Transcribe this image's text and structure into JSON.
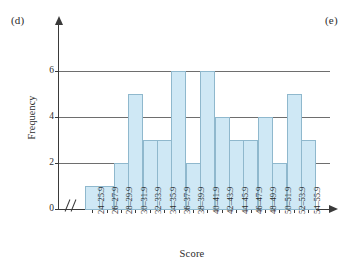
{
  "figure": {
    "panel_label_left": "(d)",
    "panel_label_right": "(e)",
    "bar_fill_color": "#cfe8f5",
    "bar_border_color": "#8fb8cd",
    "axis_color": "#3a3a3a",
    "gridline_color": "#6e6e6e",
    "axis_break_symbol": "//"
  },
  "chart_data": {
    "type": "bar",
    "title": "",
    "xlabel": "Score",
    "ylabel": "Frequency",
    "categories": [
      "24–25.9",
      "26–27.9",
      "28–29.9",
      "30–31.9",
      "32–33.9",
      "34–35.9",
      "36–37.9",
      "38–39.9",
      "40–41.9",
      "42–43.9",
      "44–45.9",
      "46–47.9",
      "48–49.9",
      "50–51.9",
      "52–53.9",
      "54–55.9"
    ],
    "values": [
      1,
      1,
      2,
      5,
      3,
      3,
      6,
      2,
      6,
      4,
      3,
      3,
      4,
      2,
      5,
      3
    ],
    "ylim": [
      0,
      7
    ],
    "yticks": [
      0,
      2,
      4,
      6
    ],
    "ytick_labels": [
      "0",
      "2",
      "4",
      "6"
    ],
    "grid": "horizontal",
    "legend": "none",
    "x_axis_has_break": true
  }
}
